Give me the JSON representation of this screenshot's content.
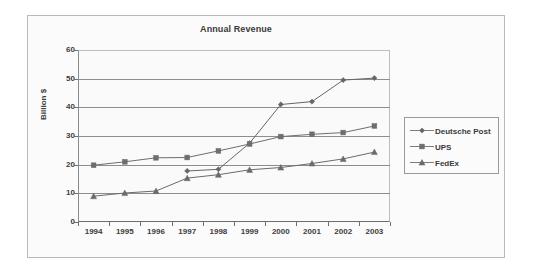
{
  "chart_data": {
    "type": "line",
    "title": "Annual Revenue",
    "xlabel": "",
    "ylabel": "Billion $",
    "x": [
      1994,
      1995,
      1996,
      1997,
      1998,
      1999,
      2000,
      2001,
      2002,
      2003
    ],
    "categories": [
      "1994",
      "1995",
      "1996",
      "1997",
      "1998",
      "1999",
      "2000",
      "2001",
      "2002",
      "2003"
    ],
    "ylim": [
      0,
      60
    ],
    "yticks": [
      0,
      10,
      20,
      30,
      40,
      50,
      60
    ],
    "ytick_labels": [
      "0",
      "10",
      "20",
      "30",
      "40",
      "50",
      "60"
    ],
    "grid": true,
    "legend_position": "right",
    "series": [
      {
        "name": "Deutsche Post",
        "marker": "diamond",
        "color": "#666666",
        "values": [
          null,
          null,
          null,
          17.8,
          18.4,
          27.5,
          41.0,
          42.0,
          49.5,
          50.2
        ]
      },
      {
        "name": "UPS",
        "marker": "square",
        "color": "#6e6e6e",
        "values": [
          19.8,
          21.0,
          22.4,
          22.5,
          24.8,
          27.2,
          29.8,
          30.6,
          31.2,
          33.5
        ]
      },
      {
        "name": "FedEx",
        "marker": "triangle",
        "color": "#6a6a6a",
        "values": [
          9.0,
          10.1,
          10.8,
          15.3,
          16.5,
          18.2,
          19.0,
          20.4,
          22.0,
          24.4
        ]
      }
    ]
  },
  "chart": {
    "title": "Annual Revenue",
    "y_axis_title": "Billion $"
  },
  "legend": {
    "items": [
      {
        "label": "Deutsche Post",
        "marker": "diamond-marker-icon"
      },
      {
        "label": "UPS",
        "marker": "square-marker-icon"
      },
      {
        "label": "FedEx",
        "marker": "triangle-marker-icon"
      }
    ]
  }
}
